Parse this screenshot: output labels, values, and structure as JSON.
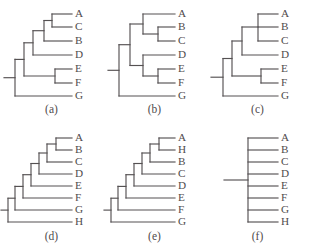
{
  "figure": {
    "type": "phylogenetic-tree-panel-figure",
    "panel_count": 6,
    "line_color": "#555152",
    "text_color": "#4f4b4c",
    "background_color": "#ffffff"
  },
  "panels": [
    {
      "id": "a",
      "caption": "(a)",
      "taxa": [
        "A",
        "C",
        "B",
        "D",
        "E",
        "F",
        "G"
      ],
      "taxa_count": 7,
      "topology": "(((((A,C),B),D),(E,F)),G)",
      "description": "fully resolved ladder-like tree with nested clades and a sister pair E,F",
      "resolved": true,
      "polytomies": 0
    },
    {
      "id": "b",
      "caption": "(b)",
      "taxa": [
        "A",
        "B",
        "C",
        "D",
        "E",
        "F",
        "G"
      ],
      "taxa_count": 7,
      "topology": "(((A,(B,C)),(D,(E,F))),G)",
      "description": "two balanced three-taxon clades A(B,C) and D(E,F) with G as outgroup",
      "resolved": true,
      "polytomies": 0
    },
    {
      "id": "c",
      "caption": "(c)",
      "taxa": [
        "A",
        "B",
        "C",
        "D",
        "E",
        "F",
        "G"
      ],
      "taxa_count": 7,
      "topology": "((((A,B,C),D),(E,F)),G)",
      "description": "contains a trifurcation (polytomy) joining A, B and C",
      "resolved": false,
      "polytomies": 1
    },
    {
      "id": "d",
      "caption": "(d)",
      "taxa": [
        "A",
        "B",
        "C",
        "D",
        "E",
        "F",
        "G",
        "H"
      ],
      "taxa_count": 8,
      "topology": "(((((((A,B),C),D),E),F),G),H)",
      "description": "fully pectinate caterpillar ladder of eight taxa",
      "resolved": true,
      "polytomies": 0
    },
    {
      "id": "e",
      "caption": "(e)",
      "taxa": [
        "A",
        "H",
        "B",
        "C",
        "D",
        "E",
        "F",
        "G"
      ],
      "taxa_count": 8,
      "topology": "(((((((A,H),B),C),D),E),F),G)",
      "description": "same ladder shape as (d) but taxon H is sister to A at the tip",
      "resolved": true,
      "polytomies": 0
    },
    {
      "id": "f",
      "caption": "(f)",
      "taxa": [
        "A",
        "B",
        "C",
        "D",
        "E",
        "F",
        "G",
        "H"
      ],
      "taxa_count": 8,
      "topology": "(A,B,C,D,E,F,G,H)",
      "description": "completely unresolved star phylogeny, single polytomy of eight taxa",
      "resolved": false,
      "polytomies": 1
    }
  ]
}
